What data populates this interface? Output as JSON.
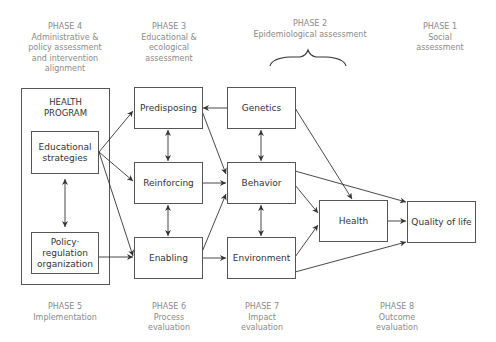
{
  "phases_top": [
    {
      "id": "phase4",
      "number": "PHASE 4",
      "lines": [
        "Administrative &",
        "policy assessment",
        "and intervention",
        "alignment"
      ]
    },
    {
      "id": "phase3",
      "number": "PHASE 3",
      "lines": [
        "Educational &",
        "ecological",
        "assessment"
      ]
    },
    {
      "id": "phase2",
      "number": "PHASE 2",
      "lines": [
        "Epidemiological assessment"
      ]
    },
    {
      "id": "phase1",
      "number": "PHASE 1",
      "lines": [
        "Social",
        "assessment"
      ]
    }
  ],
  "phases_bottom": [
    {
      "id": "phase5",
      "number": "PHASE 5",
      "lines": [
        "Implementation"
      ]
    },
    {
      "id": "phase6",
      "number": "PHASE 6",
      "lines": [
        "Process",
        "evaluation"
      ]
    },
    {
      "id": "phase7",
      "number": "PHASE 7",
      "lines": [
        "Impact",
        "evaluation"
      ]
    },
    {
      "id": "phase8",
      "number": "PHASE 8",
      "lines": [
        "Outcome",
        "evaluation"
      ]
    }
  ],
  "health_program": {
    "title_lines": [
      "HEALTH",
      "PROGRAM"
    ],
    "educational": [
      "Educational",
      "strategies"
    ],
    "policy": [
      "Policy·",
      "regulation",
      "organization"
    ]
  },
  "nodes": {
    "predisposing": "Predisposing",
    "reinforcing": "Reinforcing",
    "enabling": "Enabling",
    "genetics": "Genetics",
    "behavior": "Behavior",
    "environment": "Environment",
    "health": "Health",
    "quality_of_life": "Quality of life"
  },
  "colors": {
    "phase_text": "#8a8a8a",
    "box_border": "#555555",
    "box_text": "#333333",
    "arrow": "#333333"
  }
}
